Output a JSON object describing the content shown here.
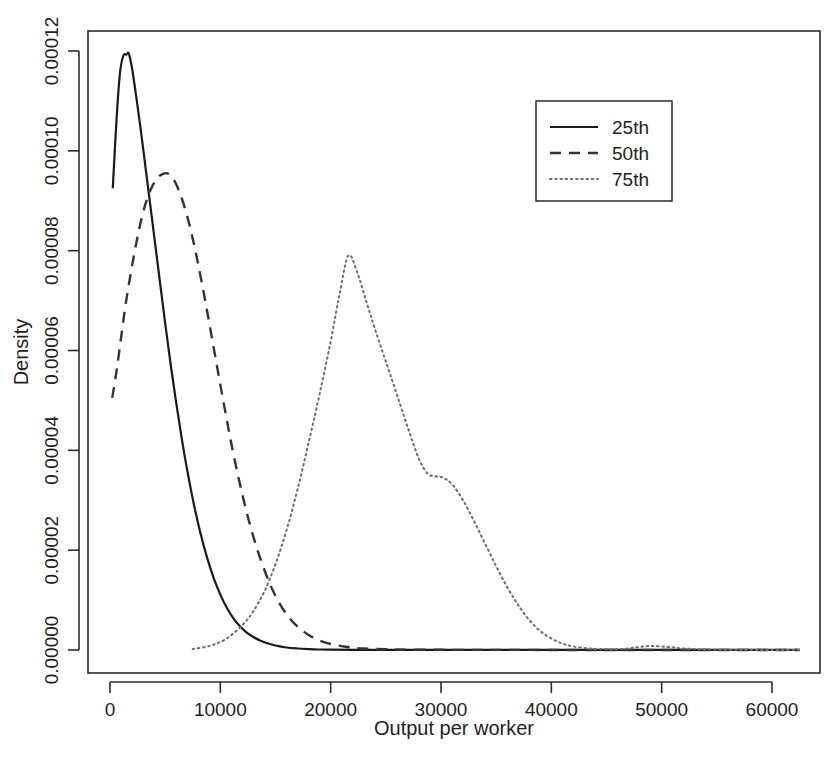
{
  "chart_data": {
    "type": "line",
    "title": "",
    "subtitle": "",
    "xlabel": "Output per worker",
    "ylabel": "Density",
    "xlim": [
      -1500,
      63500
    ],
    "ylim": [
      -3.5e-06,
      0.000125
    ],
    "grid": false,
    "legend_position": "top-right",
    "xticks": [
      0,
      10000,
      20000,
      30000,
      40000,
      50000,
      60000
    ],
    "xtick_labels": [
      "0",
      "10000",
      "20000",
      "30000",
      "40000",
      "50000",
      "60000"
    ],
    "yticks": [
      0.0,
      2e-05,
      4e-05,
      6e-05,
      8e-05,
      0.0001,
      0.00012
    ],
    "ytick_labels": [
      "0.00000",
      "0.00002",
      "0.00004",
      "0.00006",
      "0.00008",
      "0.00010",
      "0.00012"
    ],
    "series": [
      {
        "name": "25th",
        "linestyle": "solid",
        "color": "#1a1a1a",
        "peak_x": 1700,
        "peak_y": 0.0001195,
        "x": [
          250,
          600,
          900,
          1200,
          1500,
          1700,
          2000,
          2400,
          2800,
          3200,
          3600,
          4000,
          4500,
          5000,
          5500,
          6000,
          6500,
          7000,
          7600,
          8200,
          8800,
          9400,
          10000,
          10600,
          11200,
          11800,
          12400,
          13000,
          13600,
          14200,
          15000,
          16000,
          17000,
          18000,
          19000,
          20000,
          22000,
          25000,
          28000,
          32000,
          36000,
          42000,
          48000,
          54000,
          62500
        ],
        "y": [
          9.25e-05,
          0.0001065,
          0.0001155,
          0.000119,
          0.0001193,
          0.0001195,
          0.0001165,
          0.0001105,
          0.000104,
          9.7e-05,
          9e-05,
          8.3e-05,
          7.42e-05,
          6.55e-05,
          5.72e-05,
          4.95e-05,
          4.24e-05,
          3.6e-05,
          2.92e-05,
          2.34e-05,
          1.85e-05,
          1.44e-05,
          1.11e-05,
          8.4e-06,
          6.3e-06,
          4.7e-06,
          3.5e-06,
          2.6e-06,
          1.9e-06,
          1.4e-06,
          9e-07,
          5e-07,
          3e-07,
          1.8e-07,
          1e-07,
          6e-08,
          3e-08,
          2e-08,
          1e-08,
          1e-08,
          1e-08,
          1e-08,
          1e-08,
          1e-08,
          1e-08
        ]
      },
      {
        "name": "50th",
        "linestyle": "dashed",
        "color": "#333333",
        "peak_x": 5200,
        "peak_y": 9.55e-05,
        "x": [
          200,
          600,
          1000,
          1400,
          1900,
          2400,
          2900,
          3400,
          3900,
          4400,
          4800,
          5200,
          5600,
          6000,
          6500,
          7000,
          7500,
          8000,
          8600,
          9200,
          9800,
          10400,
          11000,
          11700,
          12400,
          13100,
          13800,
          14600,
          15400,
          16200,
          17000,
          18000,
          19000,
          20000,
          21500,
          23000,
          25000,
          28000,
          32000,
          36000,
          42000,
          48000,
          54000,
          62500
        ],
        "y": [
          5.05e-05,
          5.6e-05,
          6.25e-05,
          6.9e-05,
          7.57e-05,
          8.17e-05,
          8.68e-05,
          9.06e-05,
          9.32e-05,
          9.48e-05,
          9.54e-05,
          9.55e-05,
          9.48e-05,
          9.33e-05,
          9.05e-05,
          8.69e-05,
          8.24e-05,
          7.72e-05,
          7.03e-05,
          6.3e-05,
          5.56e-05,
          4.83e-05,
          4.13e-05,
          3.4e-05,
          2.75e-05,
          2.19e-05,
          1.72e-05,
          1.27e-05,
          9.2e-06,
          6.6e-06,
          4.7e-06,
          3e-06,
          1.9e-06,
          1.2e-06,
          6e-07,
          3e-07,
          1.5e-07,
          6e-08,
          3e-08,
          2e-08,
          1e-08,
          1e-08,
          1e-08,
          1e-08
        ]
      },
      {
        "name": "75th",
        "linestyle": "dotted",
        "color": "#6e6e6e",
        "peak_x": 21600,
        "peak_y": 7.9e-05,
        "x": [
          7500,
          9000,
          10500,
          12000,
          13000,
          14000,
          15000,
          16000,
          17000,
          18000,
          19000,
          20000,
          20800,
          21600,
          22400,
          23200,
          24000,
          25000,
          26000,
          27000,
          28000,
          28800,
          29500,
          30200,
          31000,
          32000,
          33000,
          34000,
          35000,
          36000,
          37000,
          38000,
          39000,
          40000,
          41000,
          42000,
          43500,
          45000,
          46500,
          47800,
          49000,
          50500,
          52000,
          54000,
          57000,
          60000,
          62500
        ],
        "y": [
          2e-07,
          8e-07,
          2.2e-06,
          5e-06,
          7.8e-06,
          1.18e-05,
          1.72e-05,
          2.4e-05,
          3.22e-05,
          4.15e-05,
          5.13e-05,
          6.18e-05,
          7.12e-05,
          7.9e-05,
          7.57e-05,
          7e-05,
          6.44e-05,
          5.78e-05,
          5.12e-05,
          4.45e-05,
          3.83e-05,
          3.53e-05,
          3.48e-05,
          3.45e-05,
          3.32e-05,
          3e-05,
          2.58e-05,
          2.13e-05,
          1.68e-05,
          1.26e-05,
          9e-06,
          6e-06,
          3.8e-06,
          2.3e-06,
          1.3e-06,
          7e-07,
          3e-07,
          1.8e-07,
          2.2e-07,
          5.5e-07,
          8e-07,
          6.2e-07,
          3e-07,
          1.2e-07,
          4e-08,
          2e-08,
          1e-08
        ]
      }
    ]
  },
  "axes": {
    "xlabel": "Output per worker",
    "ylabel": "Density"
  },
  "legend": {
    "entries": [
      {
        "label": "25th",
        "style": "solid"
      },
      {
        "label": "50th",
        "style": "dashed"
      },
      {
        "label": "75th",
        "style": "dotted"
      }
    ]
  },
  "colors": {
    "frame": "#2b2b2b",
    "solid_series": "#1a1a1a",
    "dashed_series": "#333333",
    "dotted_series": "#6e6e6e",
    "background": "#ffffff",
    "text": "#1f1f1f"
  }
}
